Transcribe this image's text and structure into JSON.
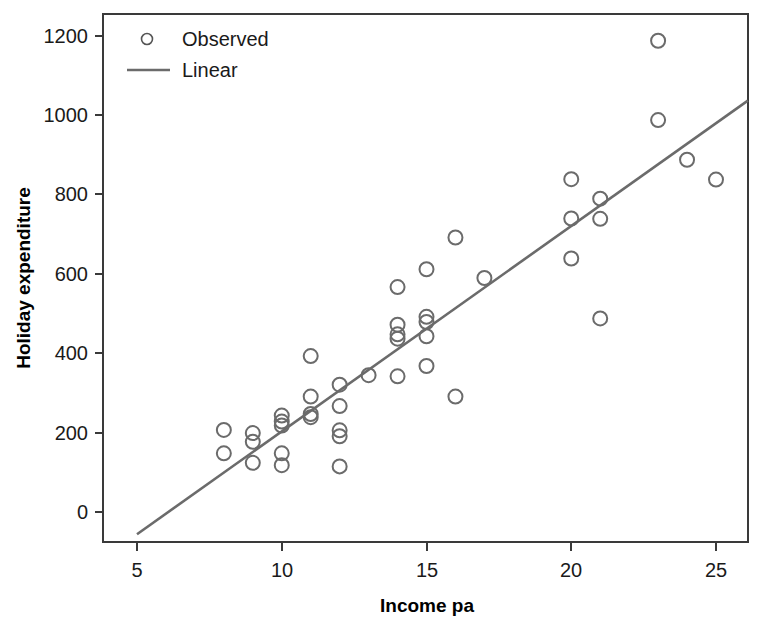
{
  "chart_data": {
    "type": "scatter",
    "title": "",
    "xlabel": "Income pa",
    "ylabel": "Holiday expenditure",
    "xlim": [
      3.9,
      26.1
    ],
    "ylim": [
      -80,
      1260
    ],
    "xticks": [
      5,
      10,
      15,
      20,
      25
    ],
    "xtick_labels": [
      "5",
      "10",
      "15",
      "20",
      "25"
    ],
    "yticks": [
      0,
      200,
      400,
      600,
      800,
      1000,
      1200
    ],
    "ytick_labels": [
      "0",
      "200",
      "400",
      "600",
      "800",
      "1000",
      "1200"
    ],
    "grid": false,
    "legend_position": "top-left",
    "legend": [
      {
        "label": "Observed",
        "marker": "open-circle",
        "color": "#6b6b6b"
      },
      {
        "label": "Linear",
        "marker": "line",
        "color": "#6b6b6b"
      }
    ],
    "series": [
      {
        "name": "Observed",
        "type": "scatter",
        "marker": "open-circle",
        "color": "#6b6b6b",
        "points": [
          {
            "x": 8,
            "y": 207
          },
          {
            "x": 8,
            "y": 148
          },
          {
            "x": 9,
            "y": 199
          },
          {
            "x": 9,
            "y": 177
          },
          {
            "x": 9,
            "y": 124
          },
          {
            "x": 10,
            "y": 243
          },
          {
            "x": 10,
            "y": 228
          },
          {
            "x": 10,
            "y": 218
          },
          {
            "x": 10,
            "y": 148
          },
          {
            "x": 10,
            "y": 118
          },
          {
            "x": 11,
            "y": 393
          },
          {
            "x": 11,
            "y": 291
          },
          {
            "x": 11,
            "y": 247
          },
          {
            "x": 11,
            "y": 239
          },
          {
            "x": 12,
            "y": 321
          },
          {
            "x": 12,
            "y": 267
          },
          {
            "x": 12,
            "y": 206
          },
          {
            "x": 12,
            "y": 191
          },
          {
            "x": 12,
            "y": 115
          },
          {
            "x": 13,
            "y": 345
          },
          {
            "x": 14,
            "y": 567
          },
          {
            "x": 14,
            "y": 472
          },
          {
            "x": 14,
            "y": 448
          },
          {
            "x": 14,
            "y": 437
          },
          {
            "x": 14,
            "y": 342
          },
          {
            "x": 15,
            "y": 612
          },
          {
            "x": 15,
            "y": 492
          },
          {
            "x": 15,
            "y": 479
          },
          {
            "x": 15,
            "y": 443
          },
          {
            "x": 15,
            "y": 368
          },
          {
            "x": 16,
            "y": 692
          },
          {
            "x": 16,
            "y": 291
          },
          {
            "x": 17,
            "y": 590
          },
          {
            "x": 20,
            "y": 839
          },
          {
            "x": 20,
            "y": 740
          },
          {
            "x": 20,
            "y": 639
          },
          {
            "x": 21,
            "y": 790
          },
          {
            "x": 21,
            "y": 739
          },
          {
            "x": 21,
            "y": 488
          },
          {
            "x": 23,
            "y": 1188
          },
          {
            "x": 23,
            "y": 988
          },
          {
            "x": 24,
            "y": 888
          },
          {
            "x": 25,
            "y": 838
          }
        ]
      },
      {
        "name": "Linear",
        "type": "line",
        "color": "#6b6b6b",
        "fit": {
          "x_start": 5,
          "y_start": -56,
          "x_end": 26.1,
          "y_end": 1037
        },
        "slope": 51.8,
        "intercept": -315
      }
    ]
  }
}
